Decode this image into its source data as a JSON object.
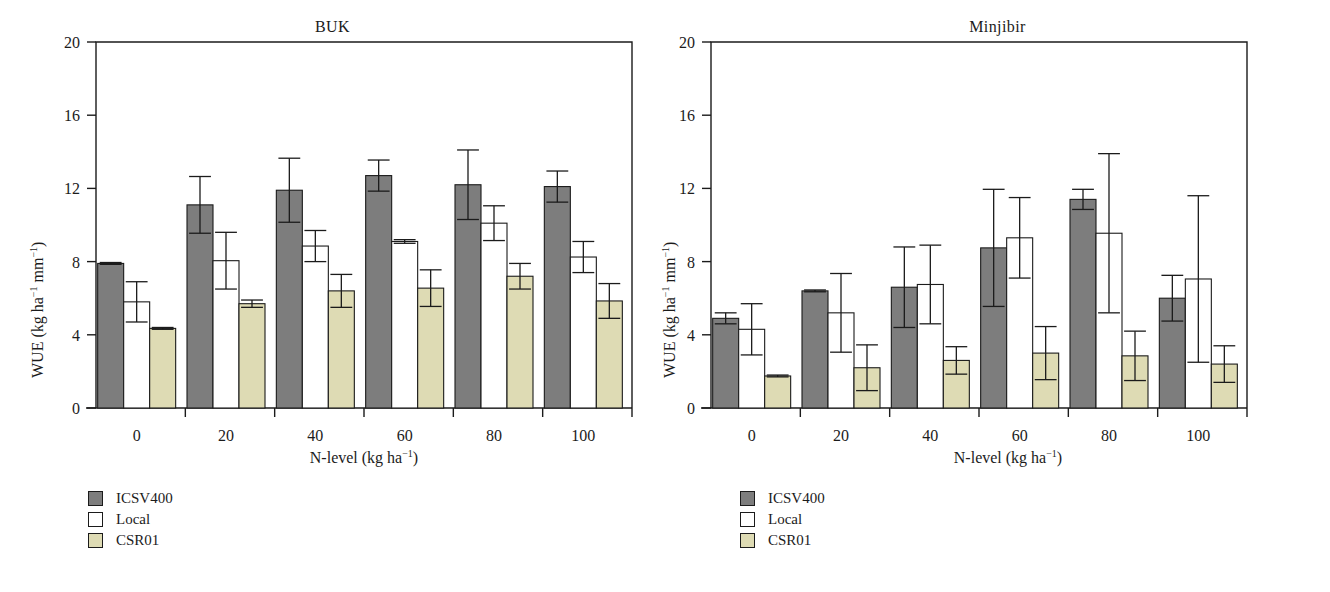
{
  "figure": {
    "background_color": "#ffffff",
    "axis_color": "#1b1b1b"
  },
  "series_colors": {
    "ICSV400": "#7d7d7d",
    "Local": "#ffffff",
    "CSR01": "#dedbb4"
  },
  "legend": {
    "items": [
      {
        "label": "ICSV400",
        "swatch": "#7d7d7d"
      },
      {
        "label": "Local",
        "swatch": "#ffffff"
      },
      {
        "label": "CSR01",
        "swatch": "#dedbb4"
      }
    ]
  },
  "axis": {
    "ylabel_prefix": "WUE (kg ha",
    "ylabel_mid": " mm",
    "ylabel_suffix": ")",
    "ysup1": "−1",
    "ysup2": "−1",
    "xlabel_prefix": "N-level (kg ha",
    "xlabel_suffix": ")",
    "xsup": "−1",
    "yticks": [
      "0",
      "4",
      "8",
      "12",
      "16",
      "20"
    ],
    "xticks": [
      "0",
      "20",
      "40",
      "60",
      "80",
      "100"
    ]
  },
  "chart_data": [
    {
      "type": "bar",
      "title": "BUK",
      "xlabel": "N-level (kg ha−1)",
      "ylabel": "WUE (kg ha−1 mm−1)",
      "ylim": [
        0,
        20
      ],
      "yticks": [
        0,
        4,
        8,
        12,
        16,
        20
      ],
      "grid": false,
      "legend_position": "below-left",
      "error_bars": true,
      "categories": [
        "0",
        "20",
        "40",
        "60",
        "80",
        "100"
      ],
      "series": [
        {
          "name": "ICSV400",
          "color": "#7d7d7d",
          "values": [
            7.9,
            11.1,
            11.9,
            12.7,
            12.2,
            12.1
          ],
          "errors": [
            0.05,
            1.55,
            1.75,
            0.85,
            1.9,
            0.85
          ]
        },
        {
          "name": "Local",
          "color": "#ffffff",
          "values": [
            5.8,
            8.05,
            8.85,
            9.1,
            10.1,
            8.25
          ],
          "errors": [
            1.1,
            1.55,
            0.85,
            0.1,
            0.95,
            0.85
          ]
        },
        {
          "name": "CSR01",
          "color": "#dedbb4",
          "values": [
            4.35,
            5.7,
            6.4,
            6.55,
            7.2,
            5.85
          ],
          "errors": [
            0.05,
            0.2,
            0.9,
            1.0,
            0.7,
            0.95
          ]
        }
      ]
    },
    {
      "type": "bar",
      "title": "Minjibir",
      "xlabel": "N-level (kg ha−1)",
      "ylabel": "WUE (kg ha−1 mm−1)",
      "ylim": [
        0,
        20
      ],
      "yticks": [
        0,
        4,
        8,
        12,
        16,
        20
      ],
      "grid": false,
      "legend_position": "below-left",
      "error_bars": true,
      "categories": [
        "0",
        "20",
        "40",
        "60",
        "80",
        "100"
      ],
      "series": [
        {
          "name": "ICSV400",
          "color": "#7d7d7d",
          "values": [
            4.9,
            6.4,
            6.6,
            8.75,
            11.4,
            6.0
          ],
          "errors": [
            0.3,
            0.05,
            2.2,
            3.2,
            0.55,
            1.25
          ]
        },
        {
          "name": "Local",
          "color": "#ffffff",
          "values": [
            4.3,
            5.2,
            6.75,
            9.3,
            9.55,
            7.05
          ],
          "errors": [
            1.4,
            2.15,
            2.15,
            2.2,
            4.35,
            4.55
          ]
        },
        {
          "name": "CSR01",
          "color": "#dedbb4",
          "values": [
            1.75,
            2.2,
            2.6,
            3.0,
            2.85,
            2.4
          ],
          "errors": [
            0.05,
            1.25,
            0.75,
            1.45,
            1.35,
            1.0
          ]
        }
      ]
    }
  ],
  "panels": [
    {
      "title": "BUK"
    },
    {
      "title": "Minjibir"
    }
  ]
}
